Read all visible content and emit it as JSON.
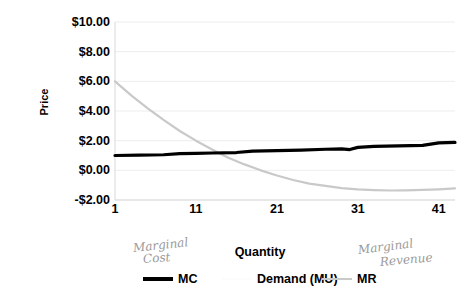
{
  "chart_data": {
    "type": "line",
    "title": "",
    "xlabel": "Quantity",
    "ylabel": "Price",
    "xlim": [
      1,
      43
    ],
    "ylim": [
      -2,
      10
    ],
    "grid": true,
    "legend_position": "bottom",
    "x_tick_labels": [
      "1",
      "11",
      "21",
      "31",
      "41"
    ],
    "x_tick_values": [
      1,
      11,
      21,
      31,
      41
    ],
    "y_tick_labels": [
      "$10.00",
      "$8.00",
      "$6.00",
      "$4.00",
      "$2.00",
      "$0.00",
      "-$2.00"
    ],
    "y_tick_values": [
      10,
      8,
      6,
      4,
      2,
      0,
      -2
    ],
    "series": [
      {
        "name": "MC",
        "color": "#000000",
        "x": [
          1,
          4,
          7,
          9,
          11,
          13,
          16,
          18,
          21,
          24,
          27,
          29,
          30,
          31,
          33,
          36,
          39,
          41,
          43
        ],
        "values": [
          1.0,
          1.02,
          1.05,
          1.12,
          1.15,
          1.17,
          1.2,
          1.3,
          1.33,
          1.36,
          1.42,
          1.45,
          1.4,
          1.55,
          1.62,
          1.65,
          1.68,
          1.85,
          1.88
        ]
      },
      {
        "name": "Demand (MU)",
        "color": "#fcfcfc",
        "x": [],
        "values": []
      },
      {
        "name": "MR",
        "color": "#c9c9c9",
        "x": [
          1,
          3,
          5,
          7,
          9,
          11,
          13,
          15,
          17,
          19,
          21,
          23,
          25,
          27,
          29,
          31,
          33,
          35,
          37,
          39,
          41,
          43
        ],
        "values": [
          6.0,
          5.05,
          4.2,
          3.4,
          2.65,
          2.0,
          1.4,
          0.85,
          0.4,
          0.0,
          -0.35,
          -0.65,
          -0.9,
          -1.05,
          -1.2,
          -1.28,
          -1.33,
          -1.36,
          -1.35,
          -1.32,
          -1.28,
          -1.22
        ]
      }
    ]
  },
  "axes": {
    "y_title": "Price",
    "x_title": "Quantity"
  },
  "legend": {
    "items": [
      {
        "label": "MC",
        "swatch": "thick",
        "color": "#000000"
      },
      {
        "label": "Demand (MU)",
        "swatch": "invisible",
        "color": "#fcfcfc"
      },
      {
        "label": "MR",
        "swatch": "thin-gray",
        "color": "#c9c9c9"
      }
    ]
  },
  "annotations": {
    "marginal_cost": {
      "line1": "Marginal",
      "line2": "Cost"
    },
    "marginal_revenue": {
      "line1": "Marginal",
      "line2": "Revenue"
    }
  }
}
